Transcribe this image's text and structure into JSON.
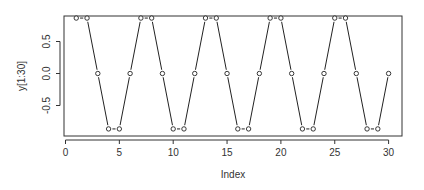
{
  "chart_data": {
    "type": "scatter",
    "plot_style": "b",
    "title": "",
    "xlabel": "Index",
    "ylabel": "y[1:30]",
    "xlim": [
      0,
      30
    ],
    "ylim": [
      -0.866,
      0.866
    ],
    "xticks": [
      0,
      5,
      10,
      15,
      20,
      25,
      30
    ],
    "yticks": [
      0.5,
      0.0,
      -0.5
    ],
    "ytick_labels": [
      "0.5",
      "0.0",
      "-0.5"
    ],
    "grid": false,
    "legend": null,
    "x": [
      1,
      2,
      3,
      4,
      5,
      6,
      7,
      8,
      9,
      10,
      11,
      12,
      13,
      14,
      15,
      16,
      17,
      18,
      19,
      20,
      21,
      22,
      23,
      24,
      25,
      26,
      27,
      28,
      29,
      30
    ],
    "values": [
      0.866,
      0.866,
      0,
      -0.866,
      -0.866,
      0,
      0.866,
      0.866,
      0,
      -0.866,
      -0.866,
      0,
      0.866,
      0.866,
      0,
      -0.866,
      -0.866,
      0,
      0.866,
      0.866,
      0,
      -0.866,
      -0.866,
      0,
      0.866,
      0.866,
      0,
      -0.866,
      -0.866,
      0
    ]
  },
  "colors": {
    "line": "#222222",
    "axis": "#333333",
    "point_fill": "#ffffff"
  }
}
